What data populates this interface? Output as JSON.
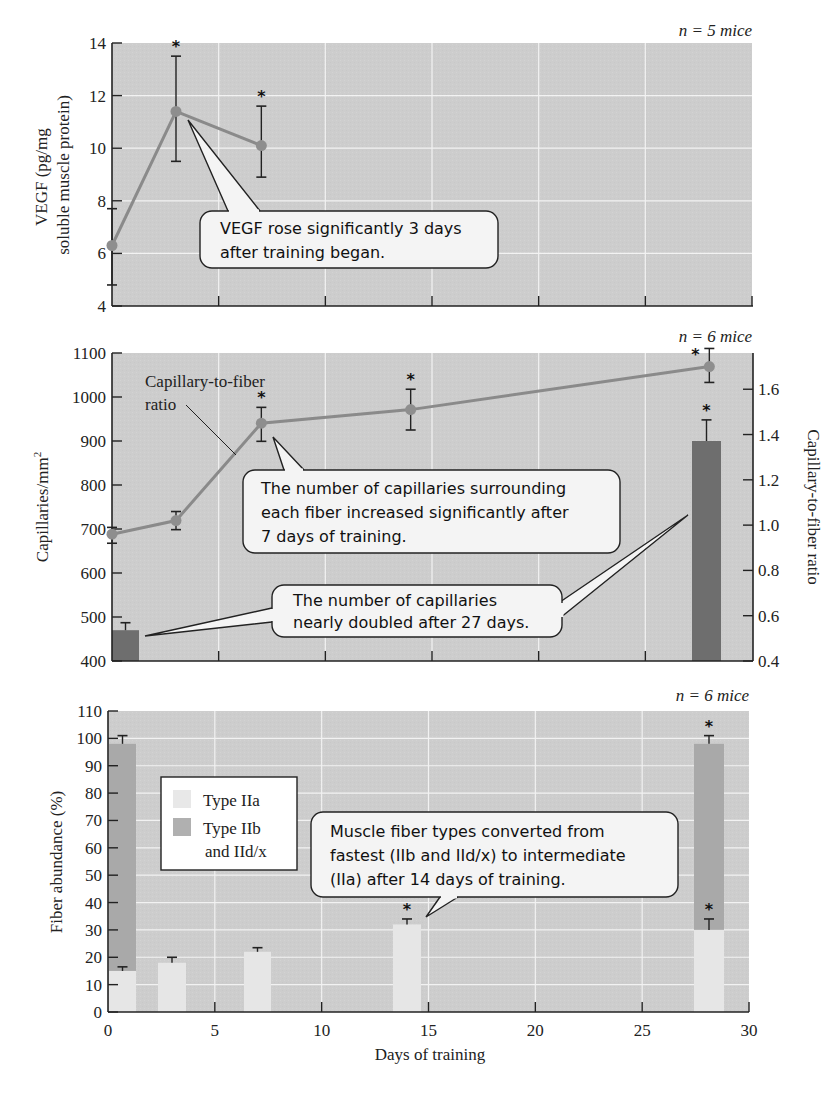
{
  "chart_data": [
    {
      "type": "line",
      "panel": "top",
      "title": "",
      "n_label": "n = 5 mice",
      "xlabel": "Days of training",
      "ylabel": "VEGF (pg/mg soluble muscle protein)",
      "ylabel_lines": [
        "VEGF (pg/mg",
        "soluble muscle protein)"
      ],
      "xlim": [
        0,
        30
      ],
      "ylim": [
        4,
        14
      ],
      "yticks": [
        4,
        6,
        8,
        10,
        12,
        14
      ],
      "grid": true,
      "series": [
        {
          "name": "VEGF",
          "x": [
            0,
            3,
            7
          ],
          "y": [
            6.3,
            11.4,
            10.1
          ],
          "err_low": [
            4.8,
            9.5,
            8.9
          ],
          "err_high": [
            7.7,
            13.5,
            11.6
          ],
          "significant": [
            false,
            true,
            true
          ]
        }
      ],
      "annotations": [
        {
          "text_lines": [
            "VEGF rose significantly 3 days",
            "after training began."
          ],
          "points_to": {
            "x": 3,
            "y": 11.4
          }
        }
      ]
    },
    {
      "type": "bar+line",
      "panel": "middle",
      "n_label": "n = 6 mice",
      "xlabel": "Days of training",
      "ylabel": "Capillaries/mm²",
      "ylabel_base": "Capillaries/mm",
      "ylabel_sup": "2",
      "y2label": "Capillary-to-fiber ratio",
      "xlim": [
        0,
        30
      ],
      "ylim": [
        400,
        1100
      ],
      "yticks": [
        400,
        500,
        600,
        700,
        800,
        900,
        1000,
        1100
      ],
      "y2lim": [
        0.4,
        1.76
      ],
      "y2ticks": [
        "0.4",
        "0.6",
        "0.8",
        "1.0",
        "1.2",
        "1.4",
        "1.6"
      ],
      "grid": true,
      "series": [
        {
          "name": "Capillaries/mm²",
          "type": "bar",
          "x": [
            0,
            27
          ],
          "y": [
            470,
            900
          ],
          "err_high": [
            487,
            948
          ],
          "significant": [
            false,
            true
          ]
        },
        {
          "name": "Capillary-to-fiber ratio",
          "type": "line",
          "x": [
            0,
            3,
            7,
            14,
            28
          ],
          "y": [
            0.96,
            1.02,
            1.45,
            1.51,
            1.7
          ],
          "err_low": [
            0.92,
            0.98,
            1.37,
            1.42,
            1.63
          ],
          "err_high": [
            0.99,
            1.06,
            1.52,
            1.6,
            1.78
          ],
          "significant": [
            false,
            false,
            true,
            true,
            true
          ]
        }
      ],
      "series_label": [
        "Capillary-to-fiber",
        "ratio"
      ],
      "annotations": [
        {
          "text_lines": [
            "The number of capillaries surrounding",
            "each fiber increased significantly after",
            "7 days of training."
          ],
          "points_to": {
            "x": 7,
            "y": 1.45
          }
        },
        {
          "text_lines": [
            "The number of capillaries",
            "nearly doubled after 27 days."
          ],
          "points_to": [
            {
              "x": 0,
              "y": 470
            },
            {
              "x": 27,
              "y": 900
            }
          ]
        }
      ]
    },
    {
      "type": "bar",
      "stacked": true,
      "panel": "bottom",
      "n_label": "n = 6 mice",
      "xlabel": "Days of training",
      "ylabel": "Fiber abundance (%)",
      "xlim": [
        0,
        30
      ],
      "xticks": [
        0,
        5,
        10,
        15,
        20,
        25,
        30
      ],
      "ylim": [
        0,
        110
      ],
      "yticks": [
        0,
        10,
        20,
        30,
        40,
        50,
        60,
        70,
        80,
        90,
        100,
        110
      ],
      "grid": true,
      "legend": {
        "position": "upper left",
        "entries": [
          {
            "label": "Type IIa",
            "color": "#e6e6e6"
          },
          {
            "label_lines": [
              "Type IIb",
              "and IId/x"
            ],
            "color": "#a9a9a9"
          }
        ]
      },
      "series": [
        {
          "name": "Type IIa",
          "x": [
            0,
            3,
            7,
            14,
            28
          ],
          "values": [
            15,
            18,
            22,
            32,
            30
          ],
          "err_high": [
            16.5,
            20,
            23.5,
            34,
            34
          ],
          "significant": [
            false,
            false,
            false,
            true,
            true
          ]
        },
        {
          "name": "Type IIb and IId/x",
          "x": [
            0,
            28
          ],
          "values": [
            83,
            68
          ],
          "total": [
            98,
            98
          ],
          "err_high": [
            101,
            101
          ],
          "significant": [
            false,
            true
          ]
        }
      ],
      "annotations": [
        {
          "text_lines": [
            "Muscle fiber types converted from",
            "fastest (IIb and IId/x) to intermediate",
            "(IIa) after 14 days of training."
          ],
          "points_to": {
            "x": 14,
            "y": 32
          }
        }
      ]
    }
  ],
  "colors": {
    "plot_bg": "#cfcfcf",
    "grid": "#f2f2f2",
    "line": "#8a8a8a",
    "marker": "#8e8e8e",
    "bar_capillaries": "#6e6e6e",
    "bar_IIa": "#e6e6e6",
    "bar_IIb": "#a9a9a9",
    "callout_bg": "#f4f4f4",
    "axis": "#222222"
  }
}
